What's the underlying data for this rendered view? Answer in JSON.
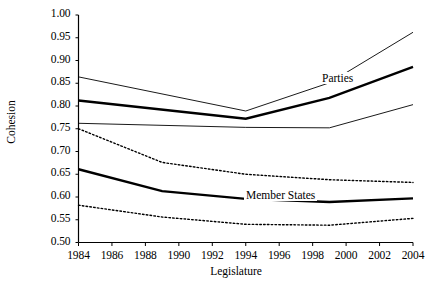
{
  "chart_data": {
    "type": "line",
    "title": "",
    "xlabel": "Legislature",
    "ylabel": "Cohesion",
    "x": [
      1984,
      1986,
      1988,
      1990,
      1992,
      1994,
      1996,
      1998,
      2000,
      2002,
      2004
    ],
    "xlim": [
      1984,
      2004
    ],
    "ylim": [
      0.5,
      1.0
    ],
    "xticks": [
      "1984",
      "1986",
      "1988",
      "1990",
      "1992",
      "1994",
      "1996",
      "1998",
      "2000",
      "2002",
      "2004"
    ],
    "yticks": [
      "0.50",
      "0.55",
      "0.60",
      "0.65",
      "0.70",
      "0.75",
      "0.80",
      "0.85",
      "0.90",
      "0.95",
      "1.00"
    ],
    "grid": false,
    "legend_position": "inline-annotations",
    "annotations": [
      {
        "text": "Parties",
        "x": 2000,
        "y": 0.835
      },
      {
        "text": "Member States",
        "x": 1997,
        "y": 0.617
      }
    ],
    "series": [
      {
        "name": "Parties",
        "role": "estimate",
        "style": "solid-bold",
        "color": "#000000",
        "x": [
          1984,
          1994,
          1999,
          2004
        ],
        "values": [
          0.812,
          0.772,
          0.818,
          0.886
        ]
      },
      {
        "name": "Parties upper bound",
        "role": "confidence-upper",
        "style": "solid-thin",
        "color": "#000000",
        "x": [
          1984,
          1994,
          1999,
          2004
        ],
        "values": [
          0.864,
          0.789,
          0.851,
          0.962
        ]
      },
      {
        "name": "Parties lower bound",
        "role": "confidence-lower",
        "style": "solid-thin",
        "color": "#000000",
        "x": [
          1984,
          1994,
          1999,
          2004
        ],
        "values": [
          0.762,
          0.753,
          0.752,
          0.803
        ]
      },
      {
        "name": "Member States",
        "role": "estimate",
        "style": "solid-bold",
        "color": "#000000",
        "x": [
          1984,
          1989,
          1994,
          1999,
          2004
        ],
        "values": [
          0.661,
          0.613,
          0.596,
          0.589,
          0.597
        ]
      },
      {
        "name": "Member States upper bound",
        "role": "confidence-upper",
        "style": "dotted",
        "color": "#000000",
        "x": [
          1984,
          1989,
          1994,
          1999,
          2004
        ],
        "values": [
          0.75,
          0.676,
          0.65,
          0.638,
          0.632
        ]
      },
      {
        "name": "Member States lower bound",
        "role": "confidence-lower",
        "style": "dotted",
        "color": "#000000",
        "x": [
          1984,
          1989,
          1994,
          1999,
          2004
        ],
        "values": [
          0.582,
          0.556,
          0.54,
          0.538,
          0.553
        ]
      }
    ]
  }
}
